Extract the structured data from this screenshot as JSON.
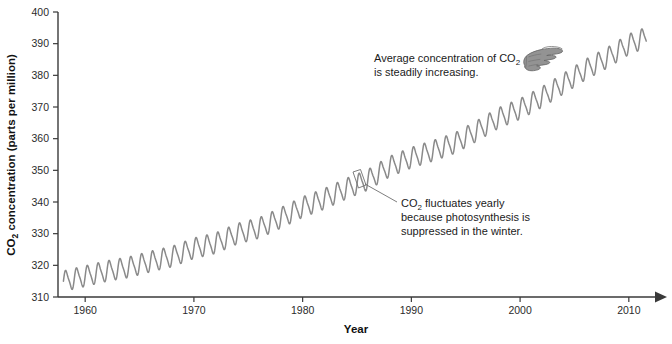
{
  "chart_data": {
    "type": "line",
    "title": "",
    "xlabel": "Year",
    "ylabel": "CO2 concentration (parts per million)",
    "ylabel_rich": [
      "CO",
      "2",
      " concentration (parts per million)"
    ],
    "xlim": [
      1957.5,
      2012.5
    ],
    "ylim": [
      310,
      400
    ],
    "xticks": [
      1960,
      1970,
      1980,
      1990,
      2000,
      2010
    ],
    "xtick_labels": [
      "1960",
      "1970",
      "1980",
      "1990",
      "2000",
      "2010"
    ],
    "yticks": [
      310,
      320,
      330,
      340,
      350,
      360,
      370,
      380,
      390,
      400
    ],
    "ytick_labels": [
      "310",
      "320",
      "330",
      "340",
      "350",
      "360",
      "370",
      "380",
      "390",
      "400"
    ],
    "grid": false,
    "legend": "none",
    "series": [
      {
        "name": "Mauna Loa atmospheric CO2",
        "color": "#8a8a8a",
        "description": "Monthly mean CO2 concentration with annual sawtooth seasonal cycle superimposed on a rising trend",
        "trend": {
          "x": [
            1958,
            1960,
            1962,
            1964,
            1966,
            1968,
            1970,
            1972,
            1974,
            1976,
            1978,
            1980,
            1982,
            1984,
            1986,
            1988,
            1990,
            1992,
            1994,
            1996,
            1998,
            2000,
            2002,
            2004,
            2006,
            2008,
            2010,
            2012
          ],
          "y": [
            315.0,
            316.6,
            318.2,
            319.4,
            321.2,
            322.8,
            325.4,
            327.0,
            330.0,
            331.8,
            335.0,
            338.4,
            341.0,
            344.2,
            347.0,
            351.2,
            354.0,
            356.2,
            358.6,
            362.4,
            366.5,
            369.4,
            373.1,
            377.4,
            381.8,
            385.5,
            389.8,
            392.5
          ]
        },
        "seasonal_amplitude_ppm": 6.0,
        "seasonal_period_years": 1.0
      }
    ],
    "annotations": [
      {
        "id": "average-trend-note",
        "lines": [
          "Average concentration of CO2",
          "is steadily increasing."
        ],
        "rich_lines": [
          [
            {
              "t": "Average concentration of CO",
              "sub": false
            },
            {
              "t": "2",
              "sub": true
            }
          ],
          [
            {
              "t": "is steadily increasing.",
              "sub": false
            }
          ]
        ],
        "x": 374,
        "y": 62,
        "icon": "pointing-hand-icon"
      },
      {
        "id": "seasonal-fluctuation-note",
        "lines": [
          "CO2 fluctuates yearly",
          "because photosynthesis is",
          "suppressed in the winter."
        ],
        "rich_lines": [
          [
            {
              "t": "CO",
              "sub": false
            },
            {
              "t": "2",
              "sub": true
            },
            {
              "t": " fluctuates yearly",
              "sub": false
            }
          ],
          [
            {
              "t": "because photosynthesis is",
              "sub": false
            }
          ],
          [
            {
              "t": "suppressed in the winter.",
              "sub": false
            }
          ]
        ],
        "x": 400,
        "y": 206,
        "leader_from": [
          361,
          181
        ],
        "leader_to": [
          396,
          201
        ],
        "highlight_year": 1986
      }
    ],
    "colors": {
      "curve": "#8a8a8a",
      "axis": "#3a3a3a",
      "tick_text": "#2b2b2b",
      "annotation_text": "#1b1b1b",
      "background": "#ffffff"
    }
  },
  "labels": {
    "x_axis_title": "Year",
    "y_axis_title_main": "CO",
    "y_axis_title_sub": "2",
    "y_axis_title_rest": " concentration (parts per million)"
  },
  "annotation_one": {
    "line1_main": "Average concentration of CO",
    "line1_sub": "2",
    "line2": "is steadily increasing."
  },
  "annotation_two": {
    "line1_main": "CO",
    "line1_sub": "2",
    "line1_rest": " fluctuates yearly",
    "line2": "because photosynthesis is",
    "line3": "suppressed in the winter."
  }
}
